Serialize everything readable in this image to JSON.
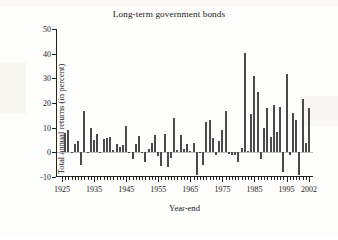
{
  "figure": {
    "title": "Long-term government bonds",
    "xlabel": "Year-end",
    "ylabel": "Total annual returns (in percent)",
    "bar_color": "#4a4a4a",
    "axis_color": "#222222",
    "background": "#fdfdfb"
  },
  "axes": {
    "y_ticks": [
      "50",
      "40",
      "30",
      "20",
      "10",
      "0",
      "-10"
    ],
    "x_ticks": [
      "1925",
      "1935",
      "1945",
      "1955",
      "1965",
      "1975",
      "1985",
      "1995",
      "2002"
    ]
  },
  "chart_data": {
    "type": "bar",
    "title": "Long-term government bonds",
    "xlabel": "Year-end",
    "ylabel": "Total annual returns (in percent)",
    "ylim": [
      -10,
      50
    ],
    "xlim": [
      1925,
      2002
    ],
    "grid": false,
    "legend": false,
    "ytick_values": [
      50,
      40,
      30,
      20,
      10,
      0,
      -10
    ],
    "xtick_values": [
      1925,
      1935,
      1945,
      1955,
      1965,
      1975,
      1985,
      1995,
      2002
    ],
    "categories": [
      1926,
      1927,
      1928,
      1929,
      1930,
      1931,
      1932,
      1933,
      1934,
      1935,
      1936,
      1937,
      1938,
      1939,
      1940,
      1941,
      1942,
      1943,
      1944,
      1945,
      1946,
      1947,
      1948,
      1949,
      1950,
      1951,
      1952,
      1953,
      1954,
      1955,
      1956,
      1957,
      1958,
      1959,
      1960,
      1961,
      1962,
      1963,
      1964,
      1965,
      1966,
      1967,
      1968,
      1969,
      1970,
      1971,
      1972,
      1973,
      1974,
      1975,
      1976,
      1977,
      1978,
      1979,
      1980,
      1981,
      1982,
      1983,
      1984,
      1985,
      1986,
      1987,
      1988,
      1989,
      1990,
      1991,
      1992,
      1993,
      1994,
      1995,
      1996,
      1997,
      1998,
      1999,
      2000,
      2001,
      2002
    ],
    "values": [
      7.8,
      8.9,
      0.1,
      3.4,
      4.7,
      -5.3,
      16.8,
      -0.1,
      10.0,
      5.0,
      7.5,
      0.2,
      5.5,
      5.9,
      6.1,
      0.9,
      3.2,
      2.1,
      2.8,
      10.7,
      -0.1,
      -2.6,
      3.4,
      6.5,
      0.1,
      -3.9,
      1.2,
      3.6,
      7.2,
      -1.3,
      -5.6,
      7.5,
      -6.1,
      -2.3,
      13.8,
      1.0,
      6.9,
      1.2,
      3.5,
      0.7,
      3.6,
      -9.2,
      -0.3,
      -5.1,
      12.1,
      13.2,
      5.7,
      -1.1,
      4.4,
      9.2,
      16.8,
      -0.7,
      -1.2,
      -1.2,
      -4.0,
      1.9,
      40.4,
      0.7,
      15.5,
      31.0,
      24.5,
      -2.7,
      9.7,
      18.1,
      6.2,
      19.3,
      8.1,
      18.2,
      -7.8,
      31.7,
      -0.9,
      15.9,
      13.1,
      -9.0,
      21.5,
      3.7,
      17.8
    ]
  }
}
